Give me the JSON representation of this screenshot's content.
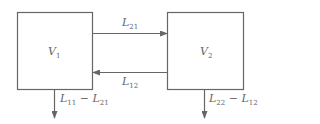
{
  "diagram": {
    "type": "two-compartment flow",
    "colors": {
      "stroke": "#666666",
      "text": "#666666",
      "background": "#ffffff"
    },
    "compartments": [
      {
        "id": "V1",
        "symbol": "V",
        "sub": "1"
      },
      {
        "id": "V2",
        "symbol": "V",
        "sub": "2"
      }
    ],
    "flows": [
      {
        "id": "L21",
        "from": "V1",
        "to": "V2",
        "symbol": "L",
        "sub": "21"
      },
      {
        "id": "L12",
        "from": "V2",
        "to": "V1",
        "symbol": "L",
        "sub": "12"
      }
    ],
    "outflows": [
      {
        "from": "V1",
        "a_sym": "L",
        "a_sub": "11",
        "op": "−",
        "b_sym": "L",
        "b_sub": "21"
      },
      {
        "from": "V2",
        "a_sym": "L",
        "a_sub": "22",
        "op": "−",
        "b_sym": "L",
        "b_sub": "12"
      }
    ]
  }
}
